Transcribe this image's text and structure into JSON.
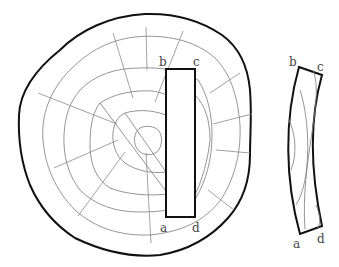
{
  "figure": {
    "colors": {
      "outline": "#111111",
      "rings": "#7a7a7a",
      "background": "#ffffff"
    },
    "log": {
      "labels": {
        "a": "a",
        "b": "b",
        "c": "c",
        "d": "d"
      }
    },
    "distorted_board": {
      "labels": {
        "a": "a",
        "b": "b",
        "c": "c",
        "d": "d"
      }
    }
  }
}
